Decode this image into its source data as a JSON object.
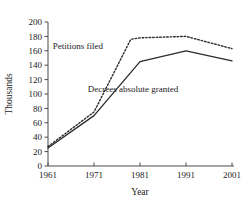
{
  "chart_data": {
    "type": "line",
    "title": "",
    "xlabel": "Year",
    "ylabel": "Thousands",
    "x": [
      1961,
      1971,
      1981,
      1991,
      2001
    ],
    "xlim": [
      1961,
      2001
    ],
    "ylim": [
      0,
      200
    ],
    "xticks": [
      "1961",
      "1971",
      "1981",
      "1991",
      "2001"
    ],
    "yticks": [
      "0",
      "20",
      "40",
      "60",
      "80",
      "100",
      "120",
      "140",
      "160",
      "180",
      "200"
    ],
    "grid": false,
    "legend_position": "inline-annotation",
    "series": [
      {
        "name": "Petitions filed",
        "style": "dotted",
        "values": [
          27,
          75,
          178,
          180,
          163
        ],
        "detail_x": [
          1961,
          1971,
          1979,
          1981,
          1991,
          2001
        ],
        "detail_values": [
          27,
          75,
          176,
          178,
          180,
          163
        ]
      },
      {
        "name": "Decrees absolute granted",
        "style": "solid",
        "values": [
          25,
          70,
          145,
          160,
          146
        ],
        "detail_x": [
          1961,
          1971,
          1981,
          1991,
          2001
        ],
        "detail_values": [
          25,
          70,
          145,
          160,
          146
        ]
      }
    ],
    "annotations": [
      {
        "text": "Petitions filed",
        "x": 1967.5,
        "y": 163
      },
      {
        "text": "Decrees absolute granted",
        "x": 1979.5,
        "y": 103
      }
    ],
    "colors": {
      "line": "#2b2b2b",
      "axis": "#4a4a4a",
      "text": "#1a1a1a",
      "background": "#ffffff"
    }
  }
}
